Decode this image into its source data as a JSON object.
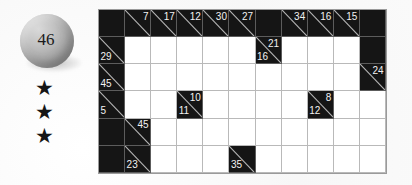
{
  "puzzle": {
    "number_badge": "46",
    "difficulty_stars": [
      "★",
      "★",
      "★"
    ],
    "star_count": 3,
    "grid": {
      "columns": 11,
      "rows": 6,
      "colors": {
        "block": "#151515",
        "open": "#ffffff",
        "grid_line": "#b9b9b9",
        "clue_text": "#f2f2f2",
        "slash": "#b5b5b5",
        "page_background": "#fafafa",
        "sphere": "#a8a8a8",
        "star": "#161616"
      },
      "cells": [
        [
          {
            "type": "block"
          },
          {
            "type": "clue",
            "down": "7"
          },
          {
            "type": "clue",
            "down": "17"
          },
          {
            "type": "clue",
            "down": "12"
          },
          {
            "type": "clue",
            "down": "30"
          },
          {
            "type": "clue",
            "down": "27"
          },
          {
            "type": "block"
          },
          {
            "type": "clue",
            "down": "34"
          },
          {
            "type": "clue",
            "down": "16"
          },
          {
            "type": "clue",
            "down": "15"
          },
          {
            "type": "block"
          }
        ],
        [
          {
            "type": "clue",
            "right": "29"
          },
          {
            "type": "open"
          },
          {
            "type": "open"
          },
          {
            "type": "open"
          },
          {
            "type": "open"
          },
          {
            "type": "open"
          },
          {
            "type": "clue",
            "down": "21",
            "right": "16"
          },
          {
            "type": "open"
          },
          {
            "type": "open"
          },
          {
            "type": "open"
          },
          {
            "type": "block"
          }
        ],
        [
          {
            "type": "clue",
            "right": "45"
          },
          {
            "type": "open"
          },
          {
            "type": "open"
          },
          {
            "type": "open"
          },
          {
            "type": "open"
          },
          {
            "type": "open"
          },
          {
            "type": "open"
          },
          {
            "type": "open"
          },
          {
            "type": "open"
          },
          {
            "type": "open"
          },
          {
            "type": "clue",
            "down": "24"
          }
        ],
        [
          {
            "type": "clue",
            "right": "5"
          },
          {
            "type": "open"
          },
          {
            "type": "open"
          },
          {
            "type": "clue",
            "down": "10",
            "right": "11"
          },
          {
            "type": "open"
          },
          {
            "type": "open"
          },
          {
            "type": "open"
          },
          {
            "type": "open"
          },
          {
            "type": "clue",
            "down": "8",
            "right": "12"
          },
          {
            "type": "open"
          },
          {
            "type": "open"
          }
        ],
        [
          {
            "type": "block"
          },
          {
            "type": "clue",
            "down": "45"
          },
          {
            "type": "open"
          },
          {
            "type": "open"
          },
          {
            "type": "open"
          },
          {
            "type": "open"
          },
          {
            "type": "open"
          },
          {
            "type": "open"
          },
          {
            "type": "open"
          },
          {
            "type": "open"
          },
          {
            "type": "open"
          }
        ],
        [
          {
            "type": "block"
          },
          {
            "type": "clue",
            "right": "23"
          },
          {
            "type": "open"
          },
          {
            "type": "open"
          },
          {
            "type": "open"
          },
          {
            "type": "clue",
            "right": "35"
          },
          {
            "type": "open"
          },
          {
            "type": "open"
          },
          {
            "type": "open"
          },
          {
            "type": "open"
          },
          {
            "type": "open"
          }
        ]
      ]
    }
  }
}
